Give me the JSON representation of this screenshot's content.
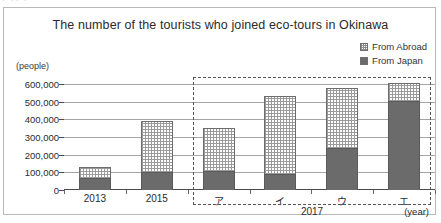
{
  "clipped_fragment": "▪ ▪▪ ▪",
  "chart_data": {
    "type": "bar",
    "subtype": "stacked-bar",
    "title": "The number of the tourists who joined eco-tours in Okinawa",
    "xlabel": "(year)",
    "ylabel": "(people)",
    "ylim": [
      0,
      600000
    ],
    "ytick_step": 100000,
    "grid": true,
    "legend_position": "top-right",
    "categories": [
      "2013",
      "2015",
      "ア",
      "イ",
      "ウ",
      "エ"
    ],
    "ytick_labels": [
      "600,000",
      "500,000",
      "400,000",
      "300,000",
      "200,000",
      "100,000",
      "0"
    ],
    "ytick_values": [
      600000,
      500000,
      400000,
      300000,
      200000,
      100000,
      0
    ],
    "series": [
      {
        "name": "From Japan",
        "color": "#6b6b6b",
        "pattern": "solid",
        "values": [
          70000,
          100000,
          110000,
          90000,
          235000,
          505000
        ]
      },
      {
        "name": "From Abroad",
        "color": "#ffffff",
        "pattern": "dotted",
        "values": [
          60000,
          290000,
          240000,
          445000,
          340000,
          100000
        ]
      }
    ],
    "totals": [
      130000,
      390000,
      350000,
      535000,
      575000,
      605000
    ],
    "annotations": {
      "group_label": "2017",
      "group_categories": [
        "ア",
        "イ",
        "ウ",
        "エ"
      ],
      "highlight_box": "dashed"
    }
  },
  "legend": {
    "items": [
      {
        "label": "From Abroad",
        "swatch": "dotted-swatch"
      },
      {
        "label": "From Japan",
        "swatch": "solid-dark-swatch"
      }
    ]
  }
}
